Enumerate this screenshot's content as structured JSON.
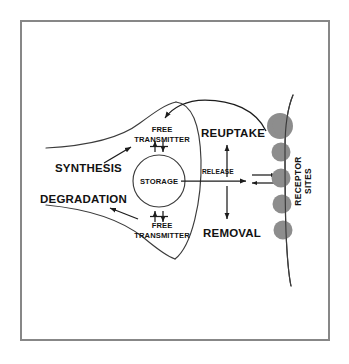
{
  "figure": {
    "background_color": "#ffffff",
    "frame_color": "#878787"
  },
  "labels": {
    "synthesis": "SYNTHESIS",
    "degradation": "DEGRADATION",
    "free_transmitter_top_line1": "FREE",
    "free_transmitter_top_line2": "TRANSMITTER",
    "storage": "STORAGE",
    "free_transmitter_bottom_line1": "FREE",
    "free_transmitter_bottom_line2": "TRANSMITTER",
    "release": "RELEASE",
    "reuptake": "REUPTAKE",
    "removal": "REMOVAL",
    "receptor_line1": "RECEPTOR",
    "receptor_line2": "SITES"
  },
  "colors": {
    "ink": "#1c1c1c",
    "outline": "#3b3b3b",
    "receptor_lobe": "#8d8d8d",
    "frame": "#878787"
  },
  "receptor_sites": {
    "lobe_count": 5,
    "lobe_color": "#8d8d8d"
  }
}
